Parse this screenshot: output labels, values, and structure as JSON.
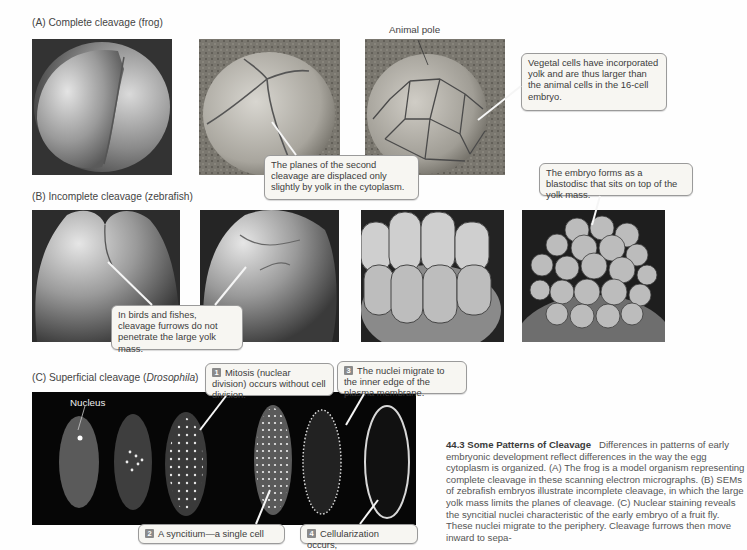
{
  "figure": {
    "panel_a": {
      "label": "(A)  Complete cleavage (frog)",
      "images": [
        "2-cell frog embryo SEM",
        "4-cell frog embryo SEM",
        "16-cell frog embryo SEM"
      ],
      "animal_pole_label": "Animal pole",
      "callout_vegetal": "Vegetal cells have incorporated yolk and are thus larger than the animal cells in the 16-cell embryo.",
      "callout_planes": "The planes of the second cleavage are displaced only slightly by yolk in the cytoplasm."
    },
    "panel_b": {
      "label": "(B)  Incomplete cleavage (zebrafish)",
      "images": [
        "2-cell zebrafish SEM",
        "4-cell zebrafish SEM",
        "8-cell zebrafish SEM",
        "blastodisc zebrafish SEM"
      ],
      "callout_blastodisc": "The embryo forms as a blastodisc that sits on top of the yolk mass.",
      "callout_furrows": "In birds and fishes, cleavage furrows do not penetrate the large yolk mass."
    },
    "panel_c": {
      "label_prefix": "(C)  Superficial cleavage (",
      "label_italic": "Drosophila",
      "label_suffix": ")",
      "nucleus_label": "Nucleus",
      "steps": [
        {
          "num": "1",
          "text": "Mitosis (nuclear division) occurs without cell division."
        },
        {
          "num": "2",
          "text": "A syncitium—a single cell"
        },
        {
          "num": "3",
          "text": "The nuclei migrate to the inner edge of the plasma membrane."
        },
        {
          "num": "4",
          "text": "Cellularization occurs,"
        }
      ]
    }
  },
  "caption": {
    "title": "44.3 Some Patterns of Cleavage",
    "body": "Differences in patterns of early embryonic development reflect differences in the way the egg cytoplasm is organized. (A) The frog is a model organism representing complete cleavage in these scanning electron micrographs. (B) SEMs of zebrafish embryos illustrate incomplete cleavage, in which the large yolk mass limits the planes of cleavage. (C) Nuclear staining reveals the syncitial nuclei characteristic of the early embryo of a fruit fly. These nuclei migrate to the periphery. Cleavage furrows then move inward to sepa-"
  }
}
